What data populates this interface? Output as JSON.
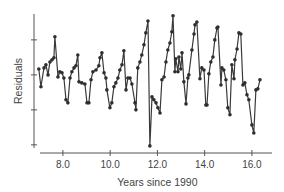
{
  "chart_data": {
    "type": "line",
    "title": "",
    "xlabel": "Years since 1990",
    "ylabel": "Residuals",
    "xlim": [
      7.03,
      16.85
    ],
    "ylim": [
      -2.09,
      1.74
    ],
    "x_ticks": [
      8.0,
      10.0,
      12.0,
      14.0,
      16.0
    ],
    "x_tick_labels": [
      "8.0",
      "10.0",
      "12.0",
      "14.0",
      "16.0"
    ],
    "y_ticks": [
      1,
      0,
      -1,
      -2
    ],
    "y_tick_labels": [
      "",
      "",
      "",
      ""
    ],
    "grid": false,
    "legend": "none",
    "markers": true,
    "colors": {
      "series": "#3a3a3a",
      "marker": "#2e2e2e",
      "axis": "#555555",
      "text": "#444444"
    },
    "series": [
      {
        "name": "Residuals",
        "x": [
          6.98,
          7.07,
          7.2,
          7.28,
          7.37,
          7.45,
          7.54,
          7.62,
          7.66,
          7.79,
          7.87,
          7.96,
          8.04,
          8.13,
          8.21,
          8.3,
          8.38,
          8.47,
          8.55,
          8.63,
          8.68,
          8.8,
          8.93,
          9.02,
          9.1,
          9.19,
          9.27,
          9.4,
          9.52,
          9.57,
          9.65,
          9.74,
          9.82,
          9.86,
          9.99,
          10.07,
          10.16,
          10.24,
          10.33,
          10.41,
          10.5,
          10.58,
          10.67,
          10.75,
          10.84,
          10.92,
          11.05,
          11.09,
          11.17,
          11.26,
          11.34,
          11.43,
          11.51,
          11.6,
          11.68,
          11.77,
          11.85,
          11.94,
          12.02,
          12.11,
          12.19,
          12.28,
          12.36,
          12.44,
          12.53,
          12.61,
          12.66,
          12.74,
          12.78,
          12.87,
          12.91,
          12.99,
          13.04,
          13.12,
          13.21,
          13.29,
          13.33,
          13.46,
          13.55,
          13.59,
          13.67,
          13.8,
          13.88,
          13.97,
          14.05,
          14.1,
          14.18,
          14.26,
          14.35,
          14.43,
          14.52,
          14.56,
          14.69,
          14.73,
          14.81,
          14.9,
          14.98,
          15.07,
          15.15,
          15.24,
          15.28,
          15.37,
          15.45,
          15.53,
          15.62,
          15.7,
          15.79,
          15.87,
          16.0,
          16.08,
          16.17,
          16.25,
          16.34
        ],
        "y": [
          0.17,
          -0.34,
          0.2,
          0.29,
          0.0,
          0.37,
          0.43,
          0.49,
          1.09,
          -0.06,
          0.09,
          0.06,
          -0.09,
          -0.71,
          -0.8,
          -0.09,
          0.09,
          0.2,
          0.26,
          0.57,
          -0.2,
          -0.23,
          -0.26,
          -0.8,
          -0.8,
          -0.14,
          0.09,
          0.14,
          0.26,
          0.49,
          0.63,
          0.06,
          -0.09,
          -0.43,
          -0.94,
          -0.8,
          -0.34,
          -0.23,
          -0.09,
          0.14,
          0.29,
          0.69,
          -0.43,
          -0.09,
          -0.09,
          -0.26,
          -0.8,
          -1.0,
          0.2,
          0.37,
          0.57,
          0.86,
          1.2,
          1.54,
          -2.03,
          -0.63,
          -0.71,
          -0.8,
          -0.94,
          -1.09,
          -0.14,
          -0.06,
          0.37,
          0.71,
          0.91,
          1.23,
          1.69,
          0.09,
          0.46,
          0.09,
          0.51,
          0.17,
          0.63,
          -0.2,
          -0.83,
          -0.09,
          0.0,
          0.71,
          1.17,
          1.43,
          1.51,
          -0.11,
          0.2,
          0.14,
          -0.86,
          -0.86,
          0.03,
          0.37,
          0.51,
          1.0,
          1.34,
          1.37,
          -0.29,
          0.2,
          0.14,
          -0.14,
          -0.94,
          -1.14,
          0.29,
          -0.11,
          0.43,
          0.74,
          1.2,
          1.17,
          -0.29,
          -0.23,
          -0.57,
          -0.71,
          -1.43,
          -1.66,
          -0.43,
          -0.4,
          -0.14
        ]
      }
    ]
  }
}
